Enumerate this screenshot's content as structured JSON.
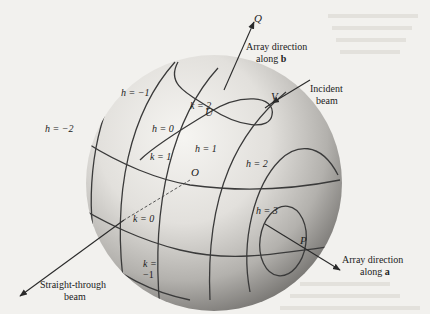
{
  "figure": {
    "colors": {
      "background": "#f2f1ee",
      "sphere_light": "#f4f3f0",
      "sphere_dark": "#6e6c69",
      "line": "#3a3a3a",
      "text": "#222222"
    },
    "points": {
      "O": "O",
      "U": "U",
      "V": "V",
      "P": "P",
      "Q": "Q"
    },
    "h_labels": {
      "h_minus_2": "h = −2",
      "h_minus_1": "h = −1",
      "h_0": "h = 0",
      "h_1": "h = 1",
      "h_2": "h = 2",
      "h_3": "h = 3"
    },
    "k_labels": {
      "k_2": "k = 2",
      "k_1": "k = 1",
      "k_0": "k = 0",
      "k_minus_1_line1": "k =",
      "k_minus_1_line2": "−1"
    },
    "annotations": {
      "array_b_line1": "Array direction",
      "array_b_line2_prefix": "along ",
      "array_b_vector": "b",
      "incident_line1": "Incident",
      "incident_line2": "beam",
      "array_a_line1": "Array direction",
      "array_a_line2_prefix": "along ",
      "array_a_vector": "a",
      "straight_line1": "Straight-through",
      "straight_line2": "beam"
    }
  }
}
